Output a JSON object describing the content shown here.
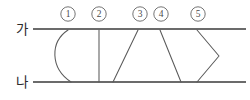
{
  "figure": {
    "background_color": "#ffffff",
    "line_color": "#5a5a5a",
    "axis_color": "#6b6b6b",
    "text_color": "#2b2b2b",
    "axis_labels": [
      {
        "name": "top-axis-label",
        "text": "가",
        "x": 22,
        "y": 29
      },
      {
        "name": "bottom-axis-label",
        "text": "나",
        "x": 22,
        "y": 82
      }
    ],
    "axes": [
      {
        "name": "top-axis-line",
        "x1": 33,
        "y1": 29,
        "x2": 246,
        "y2": 29
      },
      {
        "name": "bottom-axis-line",
        "x1": 33,
        "y1": 82,
        "x2": 246,
        "y2": 82
      }
    ],
    "markers": [
      {
        "label": "①",
        "number": "1",
        "cx": 68,
        "cy": 14,
        "r": 7.2
      },
      {
        "label": "②",
        "number": "2",
        "cx": 99,
        "cy": 14,
        "r": 7.2
      },
      {
        "label": "③",
        "number": "3",
        "cx": 140,
        "cy": 14,
        "r": 7.2
      },
      {
        "label": "④",
        "number": "4",
        "cx": 161,
        "cy": 14,
        "r": 7.2
      },
      {
        "label": "⑤",
        "number": "5",
        "cx": 198,
        "cy": 14,
        "r": 7.2
      }
    ],
    "connectors": [
      {
        "name": "connector-1-curve",
        "marker": "①",
        "shape": "curve",
        "description": "arc bulging to the left",
        "path": "M 68 30 C 50 42, 50 68, 71 82"
      },
      {
        "name": "connector-2-vertical",
        "marker": "②",
        "shape": "vertical-line",
        "description": "straight vertical segment",
        "path": "M 99 30 L 99 82"
      },
      {
        "name": "connector-3-diagonal",
        "marker": "③",
        "shape": "diagonal-line",
        "description": "diagonal sloping down to the left",
        "path": "M 138 30 L 113 82"
      },
      {
        "name": "connector-4-diagonal",
        "marker": "④",
        "shape": "diagonal-line",
        "description": "diagonal sloping down to the right",
        "path": "M 160 30 L 181 82"
      },
      {
        "name": "connector-5-chevron",
        "marker": "⑤",
        "shape": "chevron",
        "description": "V-shape pointing to the right",
        "path": "M 197 30 L 219 56 L 197 82"
      }
    ]
  }
}
